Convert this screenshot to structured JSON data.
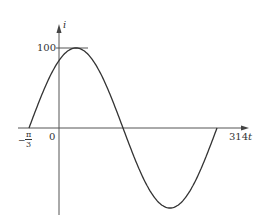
{
  "diagram": {
    "type": "sinusoidal waveform",
    "y_axis_label": "i",
    "x_axis_label_prefix": "314",
    "x_axis_label_var": "t",
    "peak_label": "100",
    "origin_label": "0",
    "phase_label_sign": "−",
    "phase_label_num": "π",
    "phase_label_den": "3",
    "colors": {
      "curve": "#333333",
      "axes": "#555555"
    }
  },
  "chart_data": {
    "type": "line",
    "title": "",
    "xlabel": "314t",
    "ylabel": "i",
    "function": "i = 100 sin(314t + π/3)",
    "amplitude": 100,
    "phase_offset": "π/3",
    "annotations": [
      "100",
      "0",
      "−π/3"
    ],
    "x_start": "−π/3",
    "grid": false
  }
}
